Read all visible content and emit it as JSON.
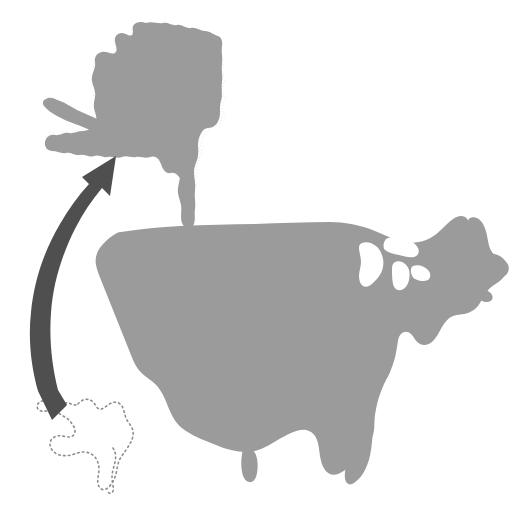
{
  "figure": {
    "background_color": "#ffffff",
    "width": 523,
    "height": 516
  },
  "colors": {
    "landmass_fill": "#9b9b9b",
    "landmass_fill_light": "#a5a5a5",
    "arrow_fill": "#4f4f4f",
    "dotted_outline_stroke": "#8d8d8d",
    "background": "#ffffff"
  },
  "elements": {
    "alaska_enlarged": {
      "name": "Alaska (enlarged, not to scale)",
      "fill": "#9b9b9b",
      "position": "upper-left",
      "bbox": [
        45,
        22,
        228,
        230
      ]
    },
    "contiguous_us": {
      "name": "Contiguous United States",
      "fill": "#9b9b9b",
      "position": "center-right-lower",
      "bbox": [
        93,
        215,
        513,
        495
      ]
    },
    "alaska_true_scale": {
      "name": "Alaska (true scale, dotted outline)",
      "stroke": "#8d8d8d",
      "stroke_style": "dotted",
      "position": "lower-left",
      "bbox": [
        38,
        396,
        140,
        492
      ]
    },
    "scale_arrow": {
      "name": "Curved scale arrow",
      "fill": "#4f4f4f",
      "direction": "from lower-left (true scale) curving up to upper-right (enlarged)",
      "head": "arrowhead at top pointing up-right",
      "tail": "swallowtail notch at bottom",
      "bbox": [
        28,
        148,
        120,
        420
      ]
    }
  },
  "texture": {
    "style": "halftone stipple",
    "opacity": 0.18
  }
}
